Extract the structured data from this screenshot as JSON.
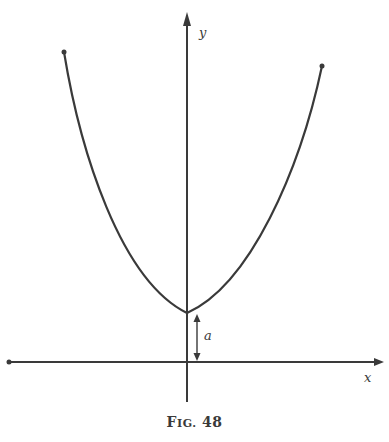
{
  "figure": {
    "caption_prefix": "F",
    "caption_smallcaps": "IG.",
    "caption_number": "48",
    "stroke_color": "#3a3a3a"
  },
  "axes": {
    "x_label": "x",
    "y_label": "y"
  },
  "annotations": {
    "offset_label": "a"
  },
  "curve": {
    "description": "catenary-like U-shaped curve with vertex on y-axis at height a above x-axis"
  }
}
